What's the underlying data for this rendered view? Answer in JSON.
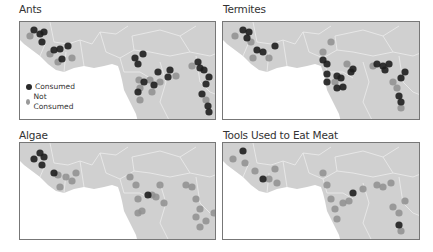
{
  "chart_data": [
    {
      "type": "scatter",
      "title": "Ants",
      "legend": [
        {
          "label": "Consumed",
          "color": "#2a2a2a"
        },
        {
          "label": "Not Consumed",
          "color": "#9a9a9a"
        }
      ],
      "legend_position": "lower-left",
      "points": {
        "consumed": [
          [
            14,
            8
          ],
          [
            20,
            12
          ],
          [
            24,
            10
          ],
          [
            22,
            20
          ],
          [
            34,
            28
          ],
          [
            40,
            27
          ],
          [
            42,
            37
          ],
          [
            48,
            24
          ],
          [
            115,
            36
          ],
          [
            118,
            42
          ],
          [
            123,
            32
          ],
          [
            138,
            50
          ],
          [
            148,
            55
          ],
          [
            150,
            48
          ],
          [
            178,
            40
          ],
          [
            180,
            46
          ],
          [
            184,
            48
          ],
          [
            189,
            55
          ],
          [
            186,
            62
          ],
          [
            182,
            72
          ],
          [
            188,
            84
          ],
          [
            189,
            90
          ],
          [
            124,
            60
          ],
          [
            134,
            63
          ],
          [
            118,
            70
          ]
        ],
        "not_consumed": [
          [
            10,
            14
          ],
          [
            30,
            32
          ],
          [
            38,
            40
          ],
          [
            52,
            36
          ],
          [
            119,
            58
          ],
          [
            120,
            66
          ],
          [
            130,
            58
          ],
          [
            132,
            70
          ],
          [
            140,
            60
          ],
          [
            156,
            54
          ],
          [
            172,
            44
          ],
          [
            186,
            78
          ],
          [
            120,
            78
          ]
        ]
      }
    },
    {
      "type": "scatter",
      "title": "Termites",
      "legend": [
        {
          "label": "Consumed",
          "color": "#2a2a2a"
        },
        {
          "label": "Not Consumed",
          "color": "#9a9a9a"
        }
      ],
      "points": {
        "consumed": [
          [
            20,
            8
          ],
          [
            26,
            10
          ],
          [
            24,
            16
          ],
          [
            34,
            28
          ],
          [
            40,
            30
          ],
          [
            52,
            24
          ],
          [
            100,
            38
          ],
          [
            104,
            42
          ],
          [
            104,
            52
          ],
          [
            104,
            60
          ],
          [
            114,
            54
          ],
          [
            128,
            50
          ],
          [
            130,
            47
          ],
          [
            118,
            56
          ],
          [
            114,
            66
          ],
          [
            120,
            65
          ],
          [
            154,
            42
          ],
          [
            160,
            44
          ],
          [
            162,
            48
          ],
          [
            166,
            42
          ],
          [
            182,
            50
          ],
          [
            178,
            56
          ],
          [
            176,
            74
          ],
          [
            178,
            80
          ]
        ],
        "not_consumed": [
          [
            12,
            14
          ],
          [
            28,
            20
          ],
          [
            30,
            36
          ],
          [
            46,
            36
          ],
          [
            108,
            20
          ],
          [
            100,
            30
          ],
          [
            124,
            42
          ],
          [
            112,
            60
          ],
          [
            150,
            44
          ],
          [
            170,
            60
          ],
          [
            174,
            66
          ],
          [
            178,
            86
          ]
        ]
      }
    },
    {
      "type": "scatter",
      "title": "Algae",
      "points": {
        "consumed": [
          [
            20,
            10
          ],
          [
            14,
            16
          ],
          [
            24,
            14
          ],
          [
            22,
            22
          ],
          [
            34,
            30
          ],
          [
            128,
            52
          ]
        ],
        "not_consumed": [
          [
            38,
            32
          ],
          [
            40,
            44
          ],
          [
            46,
            34
          ],
          [
            52,
            38
          ],
          [
            56,
            30
          ],
          [
            110,
            34
          ],
          [
            116,
            42
          ],
          [
            118,
            56
          ],
          [
            118,
            70
          ],
          [
            122,
            68
          ],
          [
            132,
            52
          ],
          [
            136,
            54
          ],
          [
            140,
            42
          ],
          [
            144,
            60
          ],
          [
            166,
            42
          ],
          [
            172,
            44
          ],
          [
            176,
            56
          ],
          [
            180,
            66
          ],
          [
            176,
            74
          ],
          [
            180,
            84
          ],
          [
            194,
            70
          ],
          [
            186,
            78
          ]
        ]
      }
    },
    {
      "type": "scatter",
      "title": "Tools Used to Eat Meat",
      "points": {
        "consumed": [
          [
            20,
            8
          ],
          [
            40,
            36
          ],
          [
            130,
            50
          ],
          [
            176,
            82
          ]
        ],
        "not_consumed": [
          [
            10,
            16
          ],
          [
            22,
            20
          ],
          [
            32,
            28
          ],
          [
            46,
            36
          ],
          [
            52,
            26
          ],
          [
            54,
            40
          ],
          [
            100,
            30
          ],
          [
            104,
            42
          ],
          [
            108,
            56
          ],
          [
            112,
            66
          ],
          [
            114,
            76
          ],
          [
            120,
            60
          ],
          [
            126,
            58
          ],
          [
            140,
            46
          ],
          [
            154,
            42
          ],
          [
            160,
            44
          ],
          [
            168,
            40
          ],
          [
            170,
            64
          ],
          [
            176,
            70
          ],
          [
            182,
            58
          ],
          [
            178,
            88
          ]
        ]
      }
    }
  ]
}
